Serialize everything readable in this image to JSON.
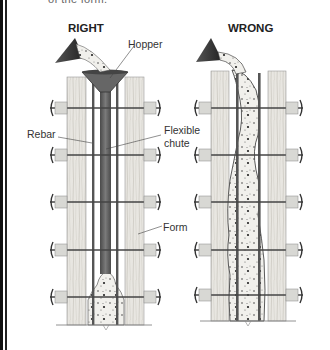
{
  "caption_fragment": "of the form.",
  "panels": {
    "right": {
      "heading": "RIGHT",
      "labels": {
        "hopper": "Hopper",
        "rebar": "Rebar",
        "chute_line1": "Flexible",
        "chute_line2": "chute",
        "form": "Form"
      }
    },
    "wrong": {
      "heading": "WRONG"
    }
  },
  "colors": {
    "border": "#111111",
    "wood": "#e6e4df",
    "wood_grain": "#b9b6ae",
    "steel": "#555555",
    "chute": "#6a6a6a",
    "concrete": "#eeeeea",
    "text": "#333333"
  }
}
